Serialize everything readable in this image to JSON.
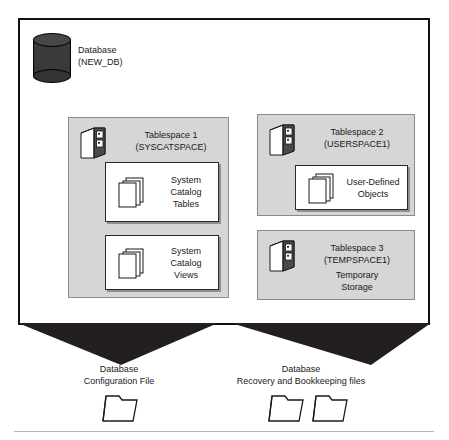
{
  "diagram": {
    "colors": {
      "boundary_stroke": "#111111",
      "tablespace_fill": "#d6d6d6",
      "tablespace_stroke": "#8a8a8a",
      "object_box_fill": "#ffffff",
      "object_box_stroke": "#2a2a2a",
      "cylinder_fill": "#3a3a3a",
      "funnel_fill": "#231f20"
    },
    "database": {
      "icon": "database-cylinder-icon",
      "label_line1": "Database",
      "label_line2": "(NEW_DB)"
    },
    "tablespaces": [
      {
        "id": "ts1",
        "icon": "cabinet-icon",
        "title_line1": "Tablespace 1",
        "title_line2": "(SYSCATSPACE)",
        "subtitle": "",
        "objects": [
          {
            "id": "obj-sct",
            "icon": "pages-stack-icon",
            "label_line1": "System",
            "label_line2": "Catalog",
            "label_line3": "Tables"
          },
          {
            "id": "obj-scv",
            "icon": "pages-stack-icon",
            "label_line1": "System",
            "label_line2": "Catalog",
            "label_line3": "Views"
          }
        ]
      },
      {
        "id": "ts2",
        "icon": "cabinet-icon",
        "title_line1": "Tablespace 2",
        "title_line2": "(USERSPACE1)",
        "subtitle": "",
        "objects": [
          {
            "id": "obj-udo",
            "icon": "pages-stack-icon",
            "label_line1": "User-Defined",
            "label_line2": "Objects",
            "label_line3": ""
          }
        ]
      },
      {
        "id": "ts3",
        "icon": "cabinet-icon",
        "title_line1": "Tablespace 3",
        "title_line2": "(TEMPSPACE1)",
        "subtitle_line1": "Temporary",
        "subtitle_line2": "Storage",
        "objects": []
      }
    ],
    "external_files": [
      {
        "id": "cap-config",
        "caption_line1": "Database",
        "caption_line2": "Configuration File",
        "folder_count": 1,
        "folder_icon": "folder-icon"
      },
      {
        "id": "cap-recov",
        "caption_line1": "Database",
        "caption_line2": "Recovery and Bookkeeping files",
        "folder_count": 2,
        "folder_icon": "folder-icon"
      }
    ]
  }
}
